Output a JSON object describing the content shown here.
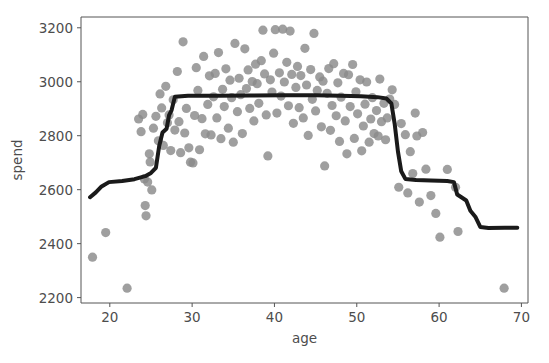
{
  "figure": {
    "title_clipped": "",
    "background_color": "#ffffff"
  },
  "axes": {
    "x_label": "age",
    "y_label": "spend",
    "x_ticks": [
      "20",
      "30",
      "40",
      "50",
      "60",
      "70"
    ],
    "y_ticks": [
      "2200",
      "2400",
      "2600",
      "2800",
      "3000",
      "3200"
    ],
    "spine_color": "#555555",
    "tick_label_color": "#4d4d4d"
  },
  "chart_data": {
    "type": "scatter",
    "title": "",
    "xlabel": "age",
    "ylabel": "spend",
    "xlim": [
      16.5,
      70.8
    ],
    "ylim": [
      2180,
      3240
    ],
    "grid": false,
    "legend": null,
    "x_ticks": [
      20,
      30,
      40,
      50,
      60,
      70
    ],
    "y_ticks": [
      2200,
      2400,
      2600,
      2800,
      3000,
      3200
    ],
    "series": [
      {
        "name": "observations",
        "type": "scatter",
        "marker": "circle",
        "color": "#8a8a8a",
        "marker_size": 6,
        "points": [
          [
            17.9,
            2350
          ],
          [
            19.5,
            2441
          ],
          [
            22.1,
            2235
          ],
          [
            23.5,
            2862
          ],
          [
            23.8,
            2815
          ],
          [
            24.0,
            2879
          ],
          [
            24.2,
            2640
          ],
          [
            24.3,
            2541
          ],
          [
            24.4,
            2503
          ],
          [
            24.6,
            2628
          ],
          [
            24.8,
            2733
          ],
          [
            24.9,
            2703
          ],
          [
            25.1,
            2599
          ],
          [
            25.3,
            2828
          ],
          [
            25.6,
            2872
          ],
          [
            25.9,
            2781
          ],
          [
            26.1,
            2955
          ],
          [
            26.3,
            2903
          ],
          [
            26.5,
            2764
          ],
          [
            26.8,
            2983
          ],
          [
            27.0,
            2848
          ],
          [
            27.2,
            2877
          ],
          [
            27.4,
            2745
          ],
          [
            27.7,
            2933
          ],
          [
            27.9,
            2821
          ],
          [
            28.2,
            3038
          ],
          [
            28.4,
            2852
          ],
          [
            28.6,
            2737
          ],
          [
            28.9,
            3148
          ],
          [
            29.1,
            2810
          ],
          [
            29.3,
            2901
          ],
          [
            29.6,
            2755
          ],
          [
            29.8,
            2702
          ],
          [
            30.1,
            2699
          ],
          [
            30.3,
            2875
          ],
          [
            30.5,
            3052
          ],
          [
            30.7,
            2968
          ],
          [
            30.9,
            2748
          ],
          [
            31.2,
            2863
          ],
          [
            31.4,
            3094
          ],
          [
            31.6,
            2807
          ],
          [
            31.9,
            2916
          ],
          [
            32.1,
            3022
          ],
          [
            32.3,
            2803
          ],
          [
            32.6,
            2944
          ],
          [
            32.8,
            3031
          ],
          [
            33.0,
            2866
          ],
          [
            33.2,
            3108
          ],
          [
            33.5,
            2789
          ],
          [
            33.7,
            2972
          ],
          [
            33.9,
            2908
          ],
          [
            34.1,
            3048
          ],
          [
            34.4,
            2828
          ],
          [
            34.6,
            3006
          ],
          [
            34.8,
            2941
          ],
          [
            35.0,
            2776
          ],
          [
            35.2,
            3142
          ],
          [
            35.5,
            2889
          ],
          [
            35.7,
            3013
          ],
          [
            35.9,
            2952
          ],
          [
            36.1,
            2808
          ],
          [
            36.4,
            3122
          ],
          [
            36.6,
            2975
          ],
          [
            36.8,
            3044
          ],
          [
            37.0,
            2901
          ],
          [
            37.3,
            3001
          ],
          [
            37.5,
            2855
          ],
          [
            37.7,
            3065
          ],
          [
            37.9,
            2993
          ],
          [
            38.1,
            2920
          ],
          [
            38.4,
            3078
          ],
          [
            38.6,
            3191
          ],
          [
            38.8,
            3029
          ],
          [
            39.0,
            2877
          ],
          [
            39.2,
            2725
          ],
          [
            39.5,
            3007
          ],
          [
            39.7,
            2962
          ],
          [
            39.9,
            3106
          ],
          [
            40.1,
            3193
          ],
          [
            40.3,
            2884
          ],
          [
            40.6,
            3033
          ],
          [
            40.8,
            2947
          ],
          [
            41.0,
            3195
          ],
          [
            41.2,
            2999
          ],
          [
            41.5,
            3072
          ],
          [
            41.7,
            2911
          ],
          [
            41.9,
            3188
          ],
          [
            42.1,
            3027
          ],
          [
            42.3,
            2846
          ],
          [
            42.6,
            2979
          ],
          [
            42.8,
            3057
          ],
          [
            43.0,
            2904
          ],
          [
            43.2,
            3023
          ],
          [
            43.5,
            2866
          ],
          [
            43.7,
            3124
          ],
          [
            43.9,
            2988
          ],
          [
            44.1,
            2801
          ],
          [
            44.4,
            3045
          ],
          [
            44.6,
            2935
          ],
          [
            44.8,
            3179
          ],
          [
            45.0,
            2892
          ],
          [
            45.2,
            2968
          ],
          [
            45.5,
            3018
          ],
          [
            45.7,
            2833
          ],
          [
            45.9,
            3002
          ],
          [
            46.1,
            2688
          ],
          [
            46.4,
            2957
          ],
          [
            46.6,
            3049
          ],
          [
            46.8,
            2820
          ],
          [
            47.0,
            2912
          ],
          [
            47.2,
            3067
          ],
          [
            47.5,
            2874
          ],
          [
            47.7,
            2996
          ],
          [
            47.9,
            2779
          ],
          [
            48.1,
            2943
          ],
          [
            48.4,
            3031
          ],
          [
            48.6,
            2855
          ],
          [
            48.8,
            2733
          ],
          [
            49.0,
            3026
          ],
          [
            49.2,
            2908
          ],
          [
            49.5,
            3064
          ],
          [
            49.7,
            2790
          ],
          [
            49.9,
            2963
          ],
          [
            50.1,
            2881
          ],
          [
            50.4,
            3007
          ],
          [
            50.6,
            2744
          ],
          [
            50.8,
            2836
          ],
          [
            51.0,
            2917
          ],
          [
            51.2,
            2999
          ],
          [
            51.5,
            2776
          ],
          [
            51.7,
            2862
          ],
          [
            51.9,
            2941
          ],
          [
            52.1,
            2808
          ],
          [
            52.4,
            2893
          ],
          [
            52.6,
            2799
          ],
          [
            52.8,
            3010
          ],
          [
            53.0,
            2852
          ],
          [
            53.3,
            2920
          ],
          [
            53.5,
            2785
          ],
          [
            53.7,
            2866
          ],
          [
            54.0,
            2936
          ],
          [
            54.3,
            2970
          ],
          [
            54.6,
            2916
          ],
          [
            55.1,
            2609
          ],
          [
            55.4,
            2845
          ],
          [
            55.9,
            2804
          ],
          [
            56.2,
            2588
          ],
          [
            56.5,
            2741
          ],
          [
            56.8,
            2660
          ],
          [
            57.1,
            2884
          ],
          [
            57.3,
            2799
          ],
          [
            57.6,
            2554
          ],
          [
            58.0,
            2812
          ],
          [
            58.4,
            2676
          ],
          [
            59.0,
            2578
          ],
          [
            59.6,
            2512
          ],
          [
            60.1,
            2424
          ],
          [
            61.0,
            2675
          ],
          [
            62.0,
            2609
          ],
          [
            62.3,
            2445
          ],
          [
            67.9,
            2235
          ]
        ]
      },
      {
        "name": "fitted-step-line",
        "type": "line",
        "color": "#1a1a1a",
        "line_width": 4,
        "points": [
          [
            17.6,
            2572
          ],
          [
            18.3,
            2590
          ],
          [
            19.0,
            2612
          ],
          [
            19.9,
            2628
          ],
          [
            21.5,
            2632
          ],
          [
            23.0,
            2639
          ],
          [
            24.3,
            2650
          ],
          [
            25.0,
            2662
          ],
          [
            25.6,
            2681
          ],
          [
            26.0,
            2762
          ],
          [
            26.4,
            2812
          ],
          [
            26.9,
            2826
          ],
          [
            27.2,
            2876
          ],
          [
            27.5,
            2894
          ],
          [
            27.9,
            2944
          ],
          [
            29.5,
            2948
          ],
          [
            33.0,
            2948
          ],
          [
            37.0,
            2949
          ],
          [
            41.0,
            2950
          ],
          [
            45.0,
            2950
          ],
          [
            48.0,
            2948
          ],
          [
            50.5,
            2946
          ],
          [
            52.5,
            2943
          ],
          [
            53.6,
            2938
          ],
          [
            54.2,
            2920
          ],
          [
            54.6,
            2845
          ],
          [
            55.0,
            2742
          ],
          [
            55.4,
            2668
          ],
          [
            55.9,
            2640
          ],
          [
            57.2,
            2636
          ],
          [
            59.0,
            2634
          ],
          [
            61.0,
            2632
          ],
          [
            61.8,
            2628
          ],
          [
            62.2,
            2582
          ],
          [
            62.8,
            2570
          ],
          [
            63.3,
            2560
          ],
          [
            63.8,
            2522
          ],
          [
            64.4,
            2500
          ],
          [
            65.0,
            2462
          ],
          [
            66.0,
            2458
          ],
          [
            68.0,
            2459
          ],
          [
            69.5,
            2459
          ]
        ]
      }
    ]
  }
}
